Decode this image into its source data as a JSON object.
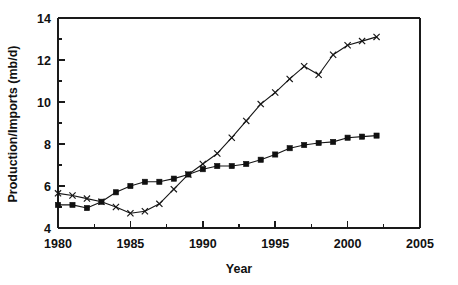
{
  "chart_data": {
    "type": "line",
    "title": "",
    "xlabel": "Year",
    "ylabel": "Production/Imports (mb/d)",
    "xlim": [
      1980,
      2005
    ],
    "ylim": [
      4,
      14
    ],
    "x_major_ticks": [
      1980,
      1985,
      1990,
      1995,
      2000,
      2005
    ],
    "x_minor_ticks": [
      1982.5,
      1987.5,
      1992.5,
      1997.5,
      2002.5
    ],
    "y_major_ticks": [
      4,
      6,
      8,
      10,
      12,
      14
    ],
    "y_minor_ticks": [
      5,
      7,
      9,
      11,
      13
    ],
    "x_tick_labels": [
      "1980",
      "1985",
      "1990",
      "1995",
      "2000",
      "2005"
    ],
    "y_tick_labels": [
      "4",
      "6",
      "8",
      "10",
      "12",
      "14"
    ],
    "grid": false,
    "legend": "none",
    "x": [
      1980,
      1981,
      1982,
      1983,
      1984,
      1985,
      1986,
      1987,
      1988,
      1989,
      1990,
      1991,
      1992,
      1993,
      1994,
      1995,
      1996,
      1997,
      1998,
      1999,
      2000,
      2001,
      2002
    ],
    "series": [
      {
        "name": "Production",
        "marker": "square",
        "values": [
          5.1,
          5.1,
          4.95,
          5.25,
          5.7,
          6.0,
          6.2,
          6.2,
          6.35,
          6.55,
          6.8,
          6.95,
          6.95,
          7.05,
          7.25,
          7.5,
          7.8,
          7.95,
          8.05,
          8.1,
          8.3,
          8.35,
          8.4
        ]
      },
      {
        "name": "Imports",
        "marker": "cross",
        "values": [
          5.65,
          5.55,
          5.4,
          5.25,
          5.0,
          4.7,
          4.8,
          5.15,
          5.85,
          6.55,
          7.05,
          7.55,
          8.3,
          9.1,
          9.9,
          10.45,
          11.1,
          11.7,
          11.3,
          12.25,
          12.7,
          12.9,
          13.1
        ]
      }
    ]
  },
  "axis_titles": {
    "x": "Year",
    "y": "Production/Imports (mb/d)"
  }
}
